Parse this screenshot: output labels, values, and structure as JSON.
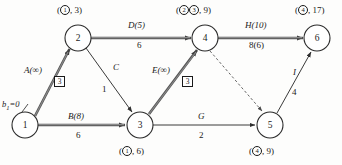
{
  "diagram": {
    "type": "network-flow-diagram",
    "supply_label": {
      "symbol": "b",
      "subscript": "1",
      "text": "=0"
    },
    "nodes": [
      {
        "id": "1",
        "cx": 25,
        "cy": 125,
        "r": 13
      },
      {
        "id": "2",
        "cx": 78,
        "cy": 38,
        "r": 13
      },
      {
        "id": "3",
        "cx": 140,
        "cy": 125,
        "r": 13
      },
      {
        "id": "4",
        "cx": 205,
        "cy": 38,
        "r": 13
      },
      {
        "id": "5",
        "cx": 270,
        "cy": 125,
        "r": 13
      },
      {
        "id": "6",
        "cx": 317,
        "cy": 38,
        "r": 13
      }
    ],
    "node_states": [
      {
        "node": "2",
        "marks": [
          "1"
        ],
        "value": "3",
        "position": "above"
      },
      {
        "node": "4",
        "marks": [
          "2",
          "3"
        ],
        "value": "9",
        "position": "above"
      },
      {
        "node": "6",
        "marks": [
          "4"
        ],
        "value": "17",
        "position": "above"
      },
      {
        "node": "3",
        "marks": [
          "1"
        ],
        "value": "6",
        "position": "below"
      },
      {
        "node": "5",
        "marks": [
          "4"
        ],
        "value": "9",
        "position": "below"
      }
    ],
    "edges": [
      {
        "id": "A",
        "from": "1",
        "to": "2",
        "name": "A(∞)",
        "weight": "",
        "style": "bold",
        "boxed_flow": "3"
      },
      {
        "id": "B",
        "from": "1",
        "to": "3",
        "name": "B(8)",
        "weight": "6",
        "style": "bold",
        "boxed_flow": ""
      },
      {
        "id": "C",
        "from": "2",
        "to": "3",
        "name": "C",
        "weight": "1",
        "style": "thin",
        "boxed_flow": ""
      },
      {
        "id": "D",
        "from": "2",
        "to": "4",
        "name": "D(5)",
        "weight": "6",
        "style": "bold",
        "boxed_flow": ""
      },
      {
        "id": "E",
        "from": "3",
        "to": "4",
        "name": "E(∞)",
        "weight": "",
        "style": "bold",
        "boxed_flow": "3"
      },
      {
        "id": "G",
        "from": "3",
        "to": "5",
        "name": "G",
        "weight": "2",
        "style": "thin",
        "boxed_flow": ""
      },
      {
        "id": "H",
        "from": "4",
        "to": "6",
        "name": "H(10)",
        "weight": "8(6)",
        "style": "bold",
        "boxed_flow": ""
      },
      {
        "id": "F",
        "from": "4",
        "to": "5",
        "name": "",
        "weight": "",
        "style": "dashed",
        "boxed_flow": ""
      },
      {
        "id": "I",
        "from": "5",
        "to": "6",
        "name": "I",
        "weight": "4",
        "style": "thin",
        "boxed_flow": ""
      }
    ],
    "colors": {
      "bold_edge": "#545454",
      "thin_edge": "#3a3a3a",
      "node_stroke": "#2b2b2b",
      "text": "#1a1a1a",
      "background": "#fdfdfc"
    }
  }
}
